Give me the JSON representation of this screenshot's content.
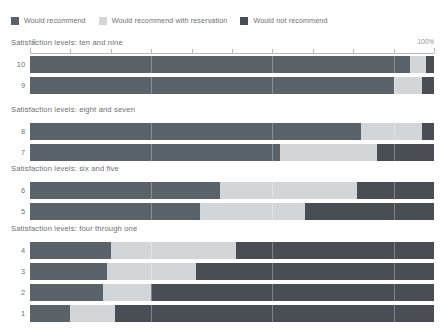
{
  "legend": {
    "items": [
      {
        "label": "Would recommend",
        "color": "#5a6369",
        "icon": "legend-swatch-icon"
      },
      {
        "label": "Would recommend with reservation",
        "color": "#d3d6d8",
        "icon": "legend-swatch-icon"
      },
      {
        "label": "Would not recommend",
        "color": "#484e53",
        "icon": "legend-swatch-icon"
      }
    ]
  },
  "axis": {
    "min_label": "0",
    "max_label": "100%",
    "ticks": [
      0,
      10,
      20,
      30,
      40,
      50,
      60,
      70,
      80,
      90,
      100
    ]
  },
  "groups": [
    {
      "title": "Satisfaction levels: ten and nine",
      "rows": [
        {
          "label": "10",
          "values": [
            94,
            4,
            2
          ]
        },
        {
          "label": "9",
          "values": [
            90,
            7,
            3
          ]
        }
      ]
    },
    {
      "title": "Satisfaction levels: eight and seven",
      "rows": [
        {
          "label": "8",
          "values": [
            82,
            15,
            3
          ]
        },
        {
          "label": "7",
          "values": [
            62,
            24,
            14
          ]
        }
      ]
    },
    {
      "title": "Satisfaction levels: six and five",
      "rows": [
        {
          "label": "6",
          "values": [
            47,
            34,
            19
          ]
        },
        {
          "label": "5",
          "values": [
            42,
            26,
            32
          ]
        }
      ]
    },
    {
      "title": "Satisfaction levels: four through one",
      "rows": [
        {
          "label": "4",
          "values": [
            20,
            31,
            49
          ]
        },
        {
          "label": "3",
          "values": [
            19,
            22,
            59
          ]
        },
        {
          "label": "2",
          "values": [
            18,
            12,
            70
          ]
        },
        {
          "label": "1",
          "values": [
            10,
            11,
            79
          ]
        }
      ]
    }
  ],
  "chart_data": {
    "type": "bar",
    "title": "",
    "orientation": "horizontal",
    "stacked": true,
    "stacked_normalized": true,
    "xlabel": "",
    "ylabel": "",
    "xlim": [
      0,
      100
    ],
    "xtick_labels": [
      "0",
      "100%"
    ],
    "grid": false,
    "legend_position": "top-left",
    "series": [
      {
        "name": "Would recommend",
        "color": "#5a6369",
        "values": [
          94,
          90,
          82,
          62,
          47,
          42,
          20,
          19,
          18,
          10
        ]
      },
      {
        "name": "Would recommend with reservation",
        "color": "#d3d6d8",
        "values": [
          4,
          7,
          15,
          24,
          34,
          26,
          31,
          22,
          12,
          11
        ]
      },
      {
        "name": "Would not recommend",
        "color": "#484e53",
        "values": [
          2,
          3,
          3,
          14,
          19,
          32,
          49,
          59,
          70,
          79
        ]
      }
    ],
    "categories": [
      "10",
      "9",
      "8",
      "7",
      "6",
      "5",
      "4",
      "3",
      "2",
      "1"
    ],
    "panels": [
      {
        "title": "Satisfaction levels: ten and nine",
        "categories": [
          "10",
          "9"
        ]
      },
      {
        "title": "Satisfaction levels: eight and seven",
        "categories": [
          "8",
          "7"
        ]
      },
      {
        "title": "Satisfaction levels: six and five",
        "categories": [
          "6",
          "5"
        ]
      },
      {
        "title": "Satisfaction levels: four through one",
        "categories": [
          "4",
          "3",
          "2",
          "1"
        ]
      }
    ],
    "annotations": []
  }
}
